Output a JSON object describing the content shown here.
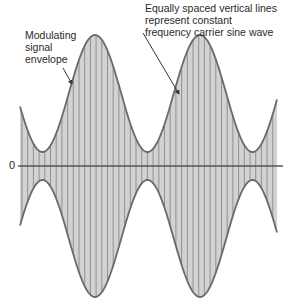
{
  "diagram": {
    "labels": {
      "modulating_envelope": "Modulating\nsignal\nenvelope",
      "carrier_lines": "Equally spaced vertical lines\nrepresent constant\nfrequency carrier sine wave",
      "zero_axis": "0"
    },
    "colors": {
      "fill": "#d2d2d2",
      "envelope": "#6a6a6a",
      "carrier_lines": "#8a8a8a",
      "axis": "#555555",
      "arrow": "#333333",
      "text": "#2a2a2a"
    },
    "geometry": {
      "zero_axis_y": 166,
      "axis_x_start": 18,
      "axis_x_end": 283,
      "wave_x_start": 20,
      "wave_x_end": 277,
      "carrier_line_spacing": 5.7,
      "envelope_min_offset": 14,
      "envelope_max_offset": 131,
      "envelope_period_px": 105,
      "envelope_first_peak_x": 95,
      "start_offset": 66
    },
    "arrows": [
      {
        "name": "modulating-envelope-arrow",
        "from": [
          63,
          68
        ],
        "to": [
          72,
          84
        ]
      },
      {
        "name": "carrier-lines-arrow",
        "from": [
          143,
          33
        ],
        "to": [
          179,
          94
        ]
      }
    ]
  }
}
